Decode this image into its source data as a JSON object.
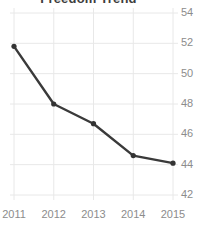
{
  "chart_data": {
    "type": "line",
    "title": "Freedom Trend",
    "xlabel": "",
    "ylabel": "",
    "categories": [
      "2011",
      "2012",
      "2013",
      "2014",
      "2015"
    ],
    "x": [
      2011,
      2012,
      2013,
      2014,
      2015
    ],
    "values": [
      51.8,
      48.0,
      46.7,
      44.6,
      44.1
    ],
    "series": [
      {
        "name": "Freedom Trend",
        "values": [
          51.8,
          48.0,
          46.7,
          44.6,
          44.1
        ]
      }
    ],
    "ylim": [
      41.3,
      54.6
    ],
    "xlim": [
      2010.9,
      2015.3
    ],
    "yticks": [
      54,
      52,
      50,
      48,
      46,
      44,
      42
    ],
    "ytick_labels": [
      "54",
      "52",
      "50",
      "48",
      "46",
      "44",
      "42"
    ],
    "xticks": [
      2011,
      2012,
      2013,
      2014,
      2015
    ],
    "xtick_labels": [
      "2011",
      "2012",
      "2013",
      "2014",
      "2015"
    ],
    "grid": true,
    "grid_axis": "both",
    "legend": false,
    "legend_position": "none",
    "y_axis_side": "right",
    "markers": true,
    "annotations": [],
    "colors": {
      "line": "#3a3a3a",
      "marker": "#333333",
      "grid": "#e8e8e8",
      "tick_label": "#8c8c8c",
      "title": "#3d3d3d",
      "background": "#ffffff"
    }
  }
}
